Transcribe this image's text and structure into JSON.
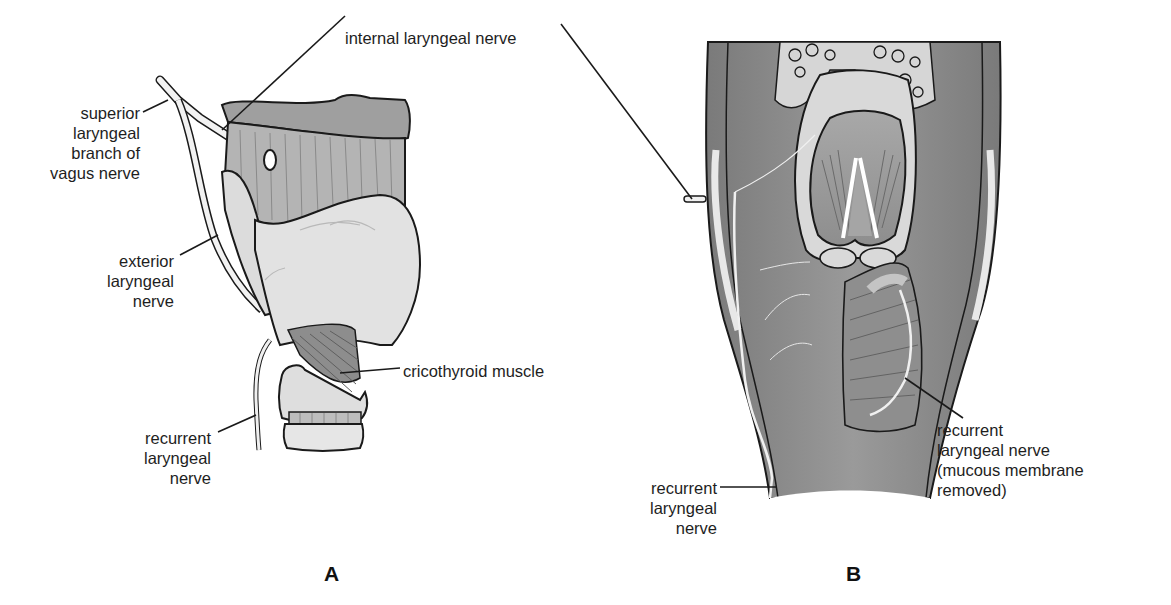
{
  "figure": {
    "panels": [
      {
        "id": "A",
        "label": "A"
      },
      {
        "id": "B",
        "label": "B"
      }
    ],
    "panel_a": {
      "labels": {
        "superior_laryngeal": [
          "superior",
          "laryngeal",
          "branch of",
          "vagus nerve"
        ],
        "internal_laryngeal": "internal laryngeal nerve",
        "exterior_laryngeal": [
          "exterior",
          "laryngeal",
          "nerve"
        ],
        "cricothyroid": "cricothyroid muscle",
        "recurrent_laryngeal": [
          "recurrent",
          "laryngeal",
          "nerve"
        ]
      }
    },
    "panel_b": {
      "labels": {
        "recurrent_laryngeal_removed": [
          "recurrent",
          "laryngeal nerve",
          "(mucous membrane",
          "removed)"
        ],
        "recurrent_laryngeal": [
          "recurrent",
          "laryngeal",
          "nerve"
        ]
      }
    },
    "colors": {
      "cartilage_light": "#e4e4e4",
      "cartilage_mid": "#b9b9b9",
      "tissue_dark": "#8c8c8c",
      "tissue_darker": "#6e6e6e",
      "outline": "#1a1a1a",
      "nerve": "#f2f2f2"
    }
  }
}
